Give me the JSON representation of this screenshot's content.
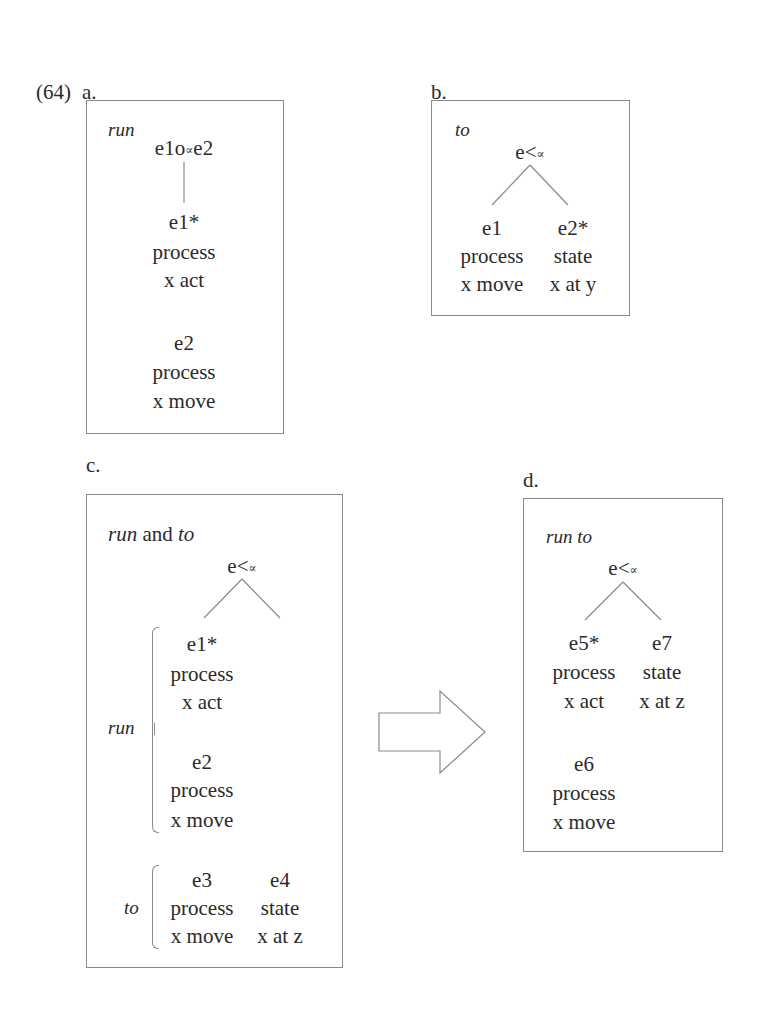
{
  "example_number": "(64)",
  "panels": {
    "a": {
      "label": "a.",
      "title": "run",
      "root": {
        "pre": "e1o",
        "sub": "∝",
        "post": "e2"
      },
      "children": [
        {
          "id": "e1*",
          "type": "process",
          "pred": "x act"
        },
        {
          "id": "e2",
          "type": "process",
          "pred": "x move"
        }
      ]
    },
    "b": {
      "label": "b.",
      "title": "to",
      "root": {
        "pre": "e<",
        "sub": "∝"
      },
      "children": [
        {
          "id": "e1",
          "type": "process",
          "pred": "x move"
        },
        {
          "id": "e2*",
          "type": "state",
          "pred": "x at y"
        }
      ]
    },
    "c": {
      "label": "c.",
      "title_part1": "run",
      "title_and": " and ",
      "title_part2": "to",
      "root": {
        "pre": "e<",
        "sub": "∝"
      },
      "groups": {
        "run": {
          "label": "run",
          "items": [
            {
              "id": "e1*",
              "type": "process",
              "pred": "x act"
            },
            {
              "id": "e2",
              "type": "process",
              "pred": "x move"
            }
          ]
        },
        "to": {
          "label": "to",
          "items": [
            {
              "id": "e3",
              "type": "process",
              "pred": "x move"
            },
            {
              "id": "e4",
              "type": "state",
              "pred": "x at z"
            }
          ]
        }
      }
    },
    "d": {
      "label": "d.",
      "title": "run to",
      "root": {
        "pre": "e<",
        "sub": "∝"
      },
      "children": [
        {
          "id": "e5*",
          "type": "process",
          "pred": "x act"
        },
        {
          "id": "e7",
          "type": "state",
          "pred": "x at z"
        }
      ],
      "extra": {
        "id": "e6",
        "type": "process",
        "pred": "x move"
      }
    }
  },
  "arrow": {
    "direction": "right",
    "meaning": "composition"
  },
  "colors": {
    "border": "#8a8a8a",
    "text": "#2a2a2a",
    "background": "#ffffff"
  }
}
